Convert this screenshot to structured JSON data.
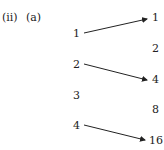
{
  "label": {
    "part": "(ii)",
    "sub": "(a)"
  },
  "domain_set": [
    "1",
    "2",
    "3",
    "4"
  ],
  "codomain_set": [
    "1",
    "2",
    "4",
    "8",
    "16"
  ],
  "arrows": [
    {
      "from": "1",
      "to": "1"
    },
    {
      "from": "2",
      "to": "4"
    },
    {
      "from": "4",
      "to": "16"
    }
  ]
}
